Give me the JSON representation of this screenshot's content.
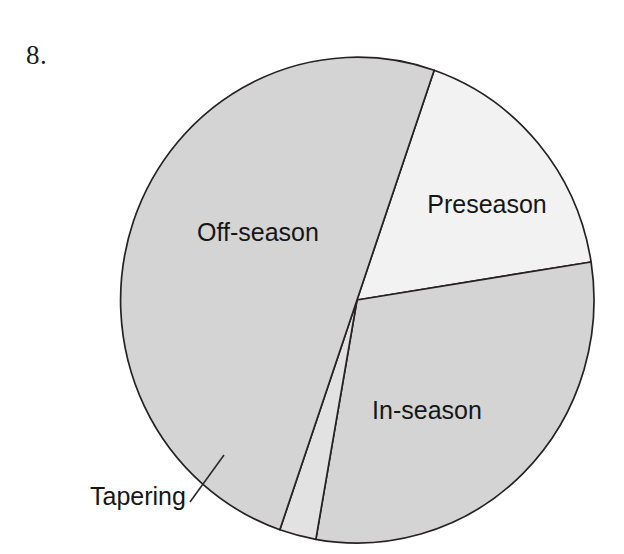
{
  "figure": {
    "number_label": "8."
  },
  "chart_data": {
    "type": "pie",
    "title": "",
    "categories": [
      "Preseason",
      "In-season",
      "Tapering",
      "Off-season"
    ],
    "values": [
      17.2,
      30.3,
      2.5,
      50.0
    ],
    "units": "percent",
    "legend": "none",
    "start_angle_deg": -71,
    "direction": "clockwise",
    "labels_inside": true,
    "slices": [
      {
        "name": "Preseason",
        "label": "Preseason",
        "value": 17.2,
        "angle_deg": 62,
        "start_angle_deg": -71,
        "end_angle_deg": -9,
        "color": "#f2f2f2",
        "label_x": 487,
        "label_y": 213,
        "label_anchor": "middle",
        "label_placement": "inside"
      },
      {
        "name": "In-season",
        "label": "In-season",
        "value": 30.3,
        "angle_deg": 109,
        "start_angle_deg": -9,
        "end_angle_deg": 100,
        "color": "#d4d4d4",
        "label_x": 427,
        "label_y": 419,
        "label_anchor": "middle",
        "label_placement": "inside"
      },
      {
        "name": "Tapering",
        "label": "Tapering",
        "value": 2.5,
        "angle_deg": 9,
        "start_angle_deg": 100,
        "end_angle_deg": 109,
        "color": "#e2e2e2",
        "label_x": 90,
        "label_y": 505,
        "label_anchor": "start",
        "label_placement": "outside-callout",
        "leader_from_x": 190,
        "leader_from_y": 502,
        "leader_to_x": 224,
        "leader_to_y": 455
      },
      {
        "name": "Off-season",
        "label": "Off-season",
        "value": 50.0,
        "angle_deg": 180,
        "start_angle_deg": 109,
        "end_angle_deg": 289,
        "color": "#d4d4d4",
        "label_x": 258,
        "label_y": 241,
        "label_anchor": "middle",
        "label_placement": "inside"
      }
    ],
    "geometry": {
      "center_x": 357,
      "center_y": 300,
      "radius_x": 237,
      "radius_y": 243
    },
    "colors": {
      "gray_fill": "#d4d4d4",
      "light_fill": "#f2f2f2",
      "tapering_fill": "#e2e2e2",
      "outline": "#262224",
      "text": "#161616",
      "background": "#ffffff"
    }
  }
}
